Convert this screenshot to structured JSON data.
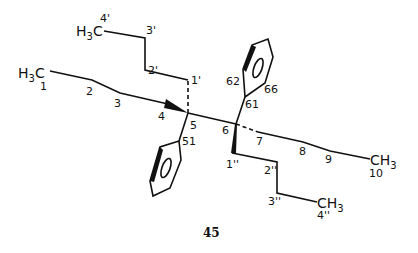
{
  "figure": {
    "compound_number": "45",
    "groups": {
      "h3c_1": "H",
      "h3c_1_sub": "3",
      "h3c_1_c": "C",
      "h3c_4p": "H",
      "h3c_4p_sub": "3",
      "h3c_4p_c": "C",
      "ch3_10": "CH",
      "ch3_10_sub": "3",
      "ch3_4pp": "CH",
      "ch3_4pp_sub": "3"
    },
    "atom_labels": {
      "c1": "1",
      "c2": "2",
      "c3": "3",
      "c4": "4",
      "c5": "5",
      "c6": "6",
      "c7": "7",
      "c8": "8",
      "c9": "9",
      "c10": "10",
      "c1p": "1'",
      "c2p": "2'",
      "c3p": "3'",
      "c4p": "4'",
      "c1pp": "1''",
      "c2pp": "2''",
      "c3pp": "3''",
      "c4pp": "4''",
      "c51": "51",
      "c61": "61",
      "c62": "62",
      "c66": "66"
    },
    "color": "#111111"
  }
}
